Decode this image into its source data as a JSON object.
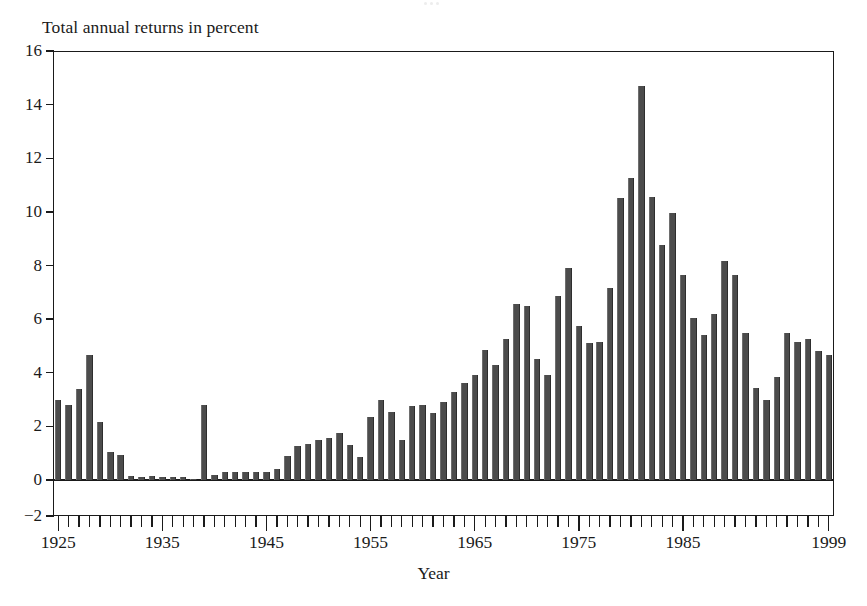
{
  "chart_data": {
    "type": "bar",
    "title": "Total annual returns in percent",
    "subtitle": "",
    "xlabel": "Year",
    "ylabel": "Total annual returns in percent",
    "ylim": [
      -2,
      16
    ],
    "xlim": [
      1925,
      1999
    ],
    "grid": false,
    "legend": null,
    "y_ticks": [
      16,
      14,
      12,
      10,
      8,
      6,
      4,
      2,
      0,
      -2
    ],
    "y_tick_labels": [
      "16",
      "14",
      "12",
      "10",
      "8",
      "6",
      "4",
      "2",
      "0",
      "−2"
    ],
    "x_tick_labels": [
      "1925",
      "1935",
      "1945",
      "1955",
      "1965",
      "1975",
      "1985",
      "1999"
    ],
    "x_tick_values": [
      1925,
      1935,
      1945,
      1955,
      1965,
      1975,
      1985,
      1999
    ],
    "bar_color": "#4c4c4c",
    "axis_color": "#1a1a1a",
    "background_color": "#ffffff",
    "categories": [
      1925,
      1926,
      1927,
      1928,
      1929,
      1930,
      1931,
      1932,
      1933,
      1934,
      1935,
      1936,
      1937,
      1938,
      1939,
      1940,
      1941,
      1942,
      1943,
      1944,
      1945,
      1946,
      1947,
      1948,
      1949,
      1950,
      1951,
      1952,
      1953,
      1954,
      1955,
      1956,
      1957,
      1958,
      1959,
      1960,
      1961,
      1962,
      1963,
      1964,
      1965,
      1966,
      1967,
      1968,
      1969,
      1970,
      1971,
      1972,
      1973,
      1974,
      1975,
      1976,
      1977,
      1978,
      1979,
      1980,
      1981,
      1982,
      1983,
      1984,
      1985,
      1986,
      1987,
      1988,
      1989,
      1990,
      1991,
      1992,
      1993,
      1994,
      1995,
      1996,
      1997,
      1998,
      1999
    ],
    "values": [
      3.0,
      2.8,
      3.4,
      4.65,
      2.15,
      1.05,
      0.95,
      0.15,
      0.1,
      0.15,
      0.1,
      0.1,
      0.1,
      0.05,
      2.8,
      0.2,
      0.3,
      0.3,
      0.3,
      0.3,
      0.3,
      0.4,
      0.9,
      1.25,
      1.35,
      1.5,
      1.55,
      1.75,
      1.3,
      0.85,
      2.35,
      3.0,
      2.55,
      1.5,
      2.75,
      2.8,
      2.5,
      2.9,
      3.3,
      3.6,
      3.9,
      4.85,
      4.3,
      5.25,
      6.55,
      6.5,
      4.5,
      3.9,
      6.85,
      7.9,
      5.75,
      5.1,
      5.15,
      7.15,
      10.5,
      11.25,
      14.7,
      10.55,
      8.75,
      9.95,
      7.65,
      6.05,
      5.4,
      6.2,
      8.15,
      7.65,
      5.5,
      3.45,
      3.0,
      3.85,
      5.5,
      5.15,
      5.25,
      4.8,
      4.65
    ]
  }
}
